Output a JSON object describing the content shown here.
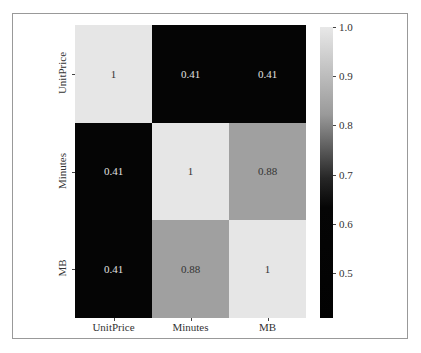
{
  "chart_data": {
    "type": "heatmap",
    "title": "",
    "rows": [
      "UnitPrice",
      "Minutes",
      "MB"
    ],
    "columns": [
      "UnitPrice",
      "Minutes",
      "MB"
    ],
    "values": [
      [
        1,
        0.41,
        0.41
      ],
      [
        0.41,
        1,
        0.88
      ],
      [
        0.41,
        0.88,
        1
      ]
    ],
    "annotations": [
      [
        "1",
        "0.41",
        "0.41"
      ],
      [
        "0.41",
        "1",
        "0.88"
      ],
      [
        "0.41",
        "0.88",
        "1"
      ]
    ],
    "colormap": "gray",
    "colorbar": {
      "ticks": [
        "1.0",
        "0.9",
        "0.8",
        "0.7",
        "0.6",
        "0.5"
      ],
      "range": [
        0.41,
        1.0
      ]
    },
    "xlabel": "",
    "ylabel": ""
  },
  "colors": {
    "high": "#e6e6e6",
    "low": "#050505",
    "mid_088": "#8f8f8f"
  }
}
